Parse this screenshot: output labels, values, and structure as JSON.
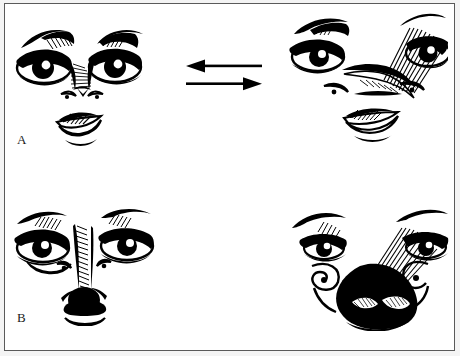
{
  "figure": {
    "type": "line-art-diagram",
    "medium": "pen-and-ink caricature illustration",
    "background_color": "#ffffff",
    "ink_color": "#000000",
    "border_color": "#5a5a5a",
    "outer_margin_color": "#f4f4f4"
  },
  "panels": [
    {
      "id": "A",
      "label": "A",
      "left_face": {
        "name": "face-normal-small-nose",
        "caption_text": "",
        "features": {
          "eyes": "large almond eyes with heavy upper lids and hatched brows",
          "nose": "small narrow nose with shaded bridge and small nostrils",
          "mouth": "full lips with cross-hatched upper lip"
        }
      },
      "right_face": {
        "name": "face-exaggerated-long-nose",
        "caption_text": "",
        "features": {
          "eyes": "almond eyes, right brow heavily hatched",
          "nose": "long broad nose sweeping into the right brow",
          "mouth": "full lips with hatched upper lip"
        }
      },
      "arrows": {
        "name": "bidirectional-arrow-pair",
        "top_direction": "left",
        "bottom_direction": "right"
      }
    },
    {
      "id": "B",
      "label": "B",
      "left_face": {
        "name": "face-normal-narrow-nose",
        "caption_text": "",
        "features": {
          "eyes": "almond eyes with hatched upper lids and arched brows",
          "nose": "very narrow hatched bridge ending in a small dark bulb",
          "mouth": "thin curved line below the nose"
        }
      },
      "right_face": {
        "name": "face-exaggerated-bulbous-nose",
        "caption_text": "",
        "features": {
          "eyes": "small droopy eyes set wide apart",
          "nose": "very large solid-black bulbous nose with highlighted nostrils",
          "mouth": "simple curved line beneath the nose"
        }
      },
      "arrows": {
        "name": "bidirectional-arrow-pair",
        "top_direction": "left",
        "bottom_direction": "right"
      }
    }
  ]
}
